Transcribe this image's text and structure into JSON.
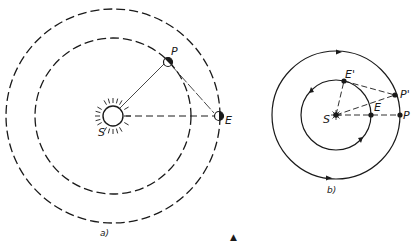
{
  "figure": {
    "panel_a": {
      "caption": "a)",
      "labels": {
        "sun": "S",
        "planet": "P",
        "earth": "E"
      },
      "sun": {
        "cx": 113,
        "cy": 116,
        "r": 10
      },
      "inner_orbit_r": 78,
      "outer_orbit_r": 107,
      "orbit_style": "dashed"
    },
    "panel_b": {
      "caption": "b)",
      "labels": {
        "sun": "S",
        "earth": "E",
        "earth_prime": "E'",
        "planet": "P",
        "planet_prime": "P'"
      },
      "sun": {
        "cx": 336,
        "cy": 115
      },
      "inner_orbit_r": 35,
      "outer_orbit_r": 64,
      "orbit_style": "solid"
    },
    "marker_symbol": "▲"
  },
  "colors": {
    "ink": "#1a1a1a",
    "background": "#ffffff"
  }
}
